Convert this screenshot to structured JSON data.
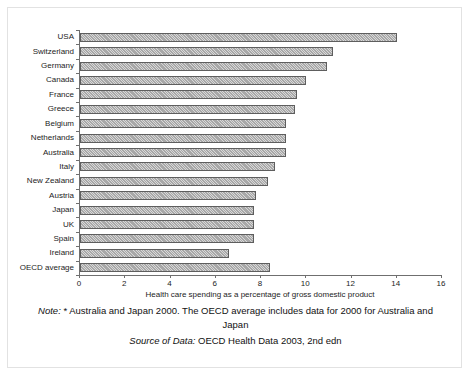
{
  "chart_data": {
    "type": "bar",
    "orientation": "horizontal",
    "title": "",
    "xlabel": "Health care spending as a percentage of gross domestic product",
    "ylabel": "",
    "xlim": [
      0,
      16
    ],
    "xticks": [
      0,
      2,
      4,
      6,
      8,
      10,
      12,
      14,
      16
    ],
    "grid": false,
    "legend": false,
    "categories": [
      "USA",
      "Switzerland",
      "Germany",
      "Canada",
      "France",
      "Greece",
      "Belgium",
      "Netherlands",
      "Australia",
      "Italy",
      "New Zealand",
      "Austria",
      "Japan",
      "UK",
      "Spain",
      "Ireland",
      "OECD average"
    ],
    "values": [
      14.0,
      11.2,
      10.9,
      10.0,
      9.6,
      9.5,
      9.1,
      9.1,
      9.1,
      8.6,
      8.3,
      7.8,
      7.7,
      7.7,
      7.7,
      6.6,
      8.4
    ],
    "bar_fill_color": "#a8a8a8",
    "bar_edge_color": "#5e5e5e",
    "axis_color": "#6f6f6f"
  },
  "caption": {
    "note_label": "Note:",
    "note_text": "* Australia and Japan 2000. The OECD average includes data for 2000 for Australia and Japan",
    "source_label": "Source of Data:",
    "source_text": "OECD Health Data 2003, 2nd edn"
  }
}
